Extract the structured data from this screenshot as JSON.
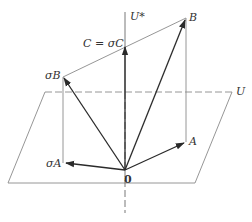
{
  "diagram": {
    "type": "geometric-vector-diagram",
    "colors": {
      "line": "#8a8a8a",
      "vector": "#2a2a2a",
      "text": "#333333",
      "background": "#ffffff"
    },
    "labels": {
      "u_star": "U*",
      "b": "B",
      "c_eq_sigma_c": "C = σC",
      "sigma_b": "σB",
      "u": "U",
      "a": "A",
      "origin": "0",
      "sigma_a": "σA"
    },
    "points": {
      "origin": [
        125,
        170
      ],
      "B": [
        186,
        18
      ],
      "sigmaB": [
        63,
        77
      ],
      "C": [
        125,
        46
      ],
      "A": [
        185,
        142
      ],
      "sigmaA": [
        65,
        163
      ]
    },
    "plane_U": {
      "vertices": [
        [
          45,
          92
        ],
        [
          232,
          92
        ],
        [
          195,
          183
        ],
        [
          8,
          183
        ]
      ]
    },
    "vectors": [
      {
        "name": "0-to-B",
        "from": "origin",
        "to": "B"
      },
      {
        "name": "0-to-sigmaB",
        "from": "origin",
        "to": "sigmaB"
      },
      {
        "name": "0-to-C",
        "from": "origin",
        "to": "C"
      },
      {
        "name": "0-to-A",
        "from": "origin",
        "to": "A"
      },
      {
        "name": "0-to-sigmaA",
        "from": "origin",
        "to": "sigmaA"
      }
    ]
  }
}
